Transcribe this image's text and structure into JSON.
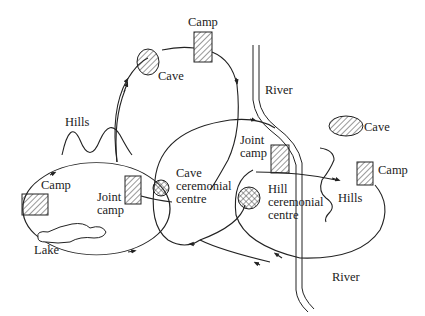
{
  "diagram": {
    "type": "seasonal movement / territory map",
    "labels": {
      "camp_top": "Camp",
      "cave_top": "Cave",
      "hills_left": "Hills",
      "camp_left": "Camp",
      "joint_camp_left_1": "Joint",
      "joint_camp_left_2": "camp",
      "cave_cc_1": "Cave",
      "cave_cc_2": "ceremonial",
      "cave_cc_3": "centre",
      "lake": "Lake",
      "river_top": "River",
      "joint_camp_right_1": "Joint",
      "joint_camp_right_2": "camp",
      "hill_cc_1": "Hill",
      "hill_cc_2": "ceremonial",
      "hill_cc_3": "centre",
      "cave_right": "Cave",
      "camp_right": "Camp",
      "hills_right": "Hills",
      "river_bottom": "River"
    },
    "nodes": [
      {
        "id": "camp-top",
        "kind": "camp",
        "label": "Camp"
      },
      {
        "id": "cave-top",
        "kind": "cave",
        "label": "Cave"
      },
      {
        "id": "camp-left",
        "kind": "camp",
        "label": "Camp"
      },
      {
        "id": "joint-camp-left",
        "kind": "joint camp",
        "label": "Joint camp"
      },
      {
        "id": "cave-ceremonial-centre",
        "kind": "ceremonial centre",
        "label": "Cave ceremonial centre"
      },
      {
        "id": "joint-camp-right",
        "kind": "joint camp",
        "label": "Joint camp"
      },
      {
        "id": "hill-ceremonial-centre",
        "kind": "ceremonial centre",
        "label": "Hill ceremonial centre"
      },
      {
        "id": "cave-right",
        "kind": "cave",
        "label": "Cave"
      },
      {
        "id": "camp-right",
        "kind": "camp",
        "label": "Camp"
      }
    ],
    "features": [
      "Hills",
      "Lake",
      "River",
      "Hills"
    ],
    "legend_symbols": {
      "camp": "hatched rectangle",
      "cave": "hatched ellipse",
      "ceremonial_centre": "cross-hatched circle"
    }
  }
}
